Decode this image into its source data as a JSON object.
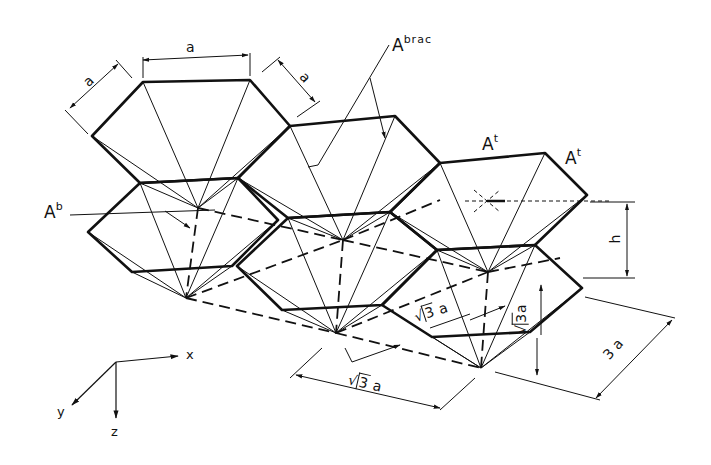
{
  "figure": {
    "labels": {
      "a_top": "a",
      "a_left": "a",
      "a_right": "a",
      "abrac_base": "A",
      "abrac_sup": "brac",
      "ab_base": "A",
      "ab_sup": "b",
      "at1_base": "A",
      "at1_sup": "t",
      "at2_base": "A",
      "at2_sup": "t",
      "h": "h",
      "sqrt3a_inner_1_num": "3",
      "sqrt3a_inner_1_var": "a",
      "sqrt3a_inner_2_num": "3",
      "sqrt3a_inner_2_var": "a",
      "sqrt3a_bottom_num": "3",
      "sqrt3a_bottom_var": "a",
      "three_a_num": "3",
      "three_a_var": "a"
    },
    "axes": {
      "x": "x",
      "y": "y",
      "z": "z"
    },
    "colors": {
      "ink": "#111111",
      "paper": "#ffffff"
    }
  }
}
